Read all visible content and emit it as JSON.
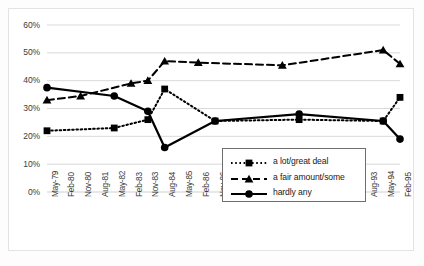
{
  "chart_data": {
    "type": "line",
    "title": "",
    "xlabel": "",
    "ylabel": "",
    "ylim": [
      0,
      60
    ],
    "yticks": [
      "0%",
      "10%",
      "20%",
      "30%",
      "40%",
      "50%",
      "60%"
    ],
    "grid": true,
    "legend_position": "center-right",
    "categories": [
      "May-79",
      "Feb-80",
      "Nov-80",
      "Aug-81",
      "May-82",
      "Feb-83",
      "Nov-83",
      "Aug-84",
      "May-85",
      "Feb-86",
      "Nov-86",
      "Aug-87",
      "May-88",
      "Feb-89",
      "Nov-89",
      "Aug-90",
      "May-91",
      "Feb-92",
      "Nov-92",
      "Aug-93",
      "May-94",
      "Feb-95"
    ],
    "series": [
      {
        "name": "a lot/great deal",
        "marker": "square",
        "line_style": "dotted",
        "color": "#000000",
        "points": [
          {
            "x": "May-79",
            "y": 22
          },
          {
            "x": "May-82",
            "y": 23
          },
          {
            "x": "Nov-83",
            "y": 26
          },
          {
            "x": "Aug-84",
            "y": 37
          },
          {
            "x": "Nov-86",
            "y": 25.5
          },
          {
            "x": "Aug-90",
            "y": 26
          },
          {
            "x": "May-94",
            "y": 25.5
          },
          {
            "x": "Feb-95",
            "y": 34
          }
        ]
      },
      {
        "name": "a fair amount/some",
        "marker": "triangle",
        "line_style": "dashed",
        "color": "#000000",
        "points": [
          {
            "x": "May-79",
            "y": 33
          },
          {
            "x": "Nov-80",
            "y": 34.5
          },
          {
            "x": "Feb-83",
            "y": 39
          },
          {
            "x": "Nov-83",
            "y": 40
          },
          {
            "x": "Aug-84",
            "y": 47
          },
          {
            "x": "Feb-86",
            "y": 46.5
          },
          {
            "x": "Nov-89",
            "y": 45.5
          },
          {
            "x": "May-94",
            "y": 51
          },
          {
            "x": "Feb-95",
            "y": 46
          }
        ]
      },
      {
        "name": "hardly any",
        "marker": "circle",
        "line_style": "solid",
        "color": "#000000",
        "points": [
          {
            "x": "May-79",
            "y": 37.5
          },
          {
            "x": "May-82",
            "y": 34.5
          },
          {
            "x": "Nov-83",
            "y": 29
          },
          {
            "x": "Aug-84",
            "y": 16
          },
          {
            "x": "Nov-86",
            "y": 25.5
          },
          {
            "x": "Aug-90",
            "y": 28
          },
          {
            "x": "May-94",
            "y": 25.5
          },
          {
            "x": "Feb-95",
            "y": 19
          }
        ]
      }
    ]
  }
}
